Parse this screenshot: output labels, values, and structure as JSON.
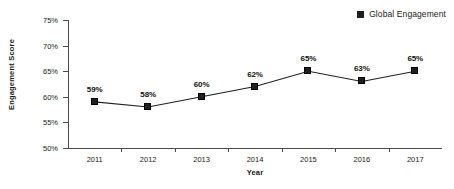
{
  "chart_data": {
    "type": "line",
    "title": "",
    "xlabel": "Year",
    "ylabel": "Engagement Score",
    "categories": [
      "2011",
      "2012",
      "2013",
      "2014",
      "2015",
      "2016",
      "2017"
    ],
    "values": [
      59,
      58,
      60,
      62,
      65,
      63,
      65
    ],
    "point_labels": [
      "59%",
      "58%",
      "60%",
      "62%",
      "65%",
      "63%",
      "65%"
    ],
    "series": [
      {
        "name": "Global Engagement",
        "values": [
          59,
          58,
          60,
          62,
          65,
          63,
          65
        ]
      }
    ],
    "ylim": [
      50,
      75
    ],
    "ytick_values": [
      75,
      70,
      65,
      60,
      55,
      50
    ],
    "ytick_labels": [
      "75%",
      "70%",
      "65%",
      "60%",
      "55%",
      "50%"
    ],
    "grid": false,
    "legend_position": "top-right",
    "marker": "square",
    "colors": {
      "series": "#1f1f1f",
      "axis": "#4a4a4a",
      "text": "#1a1a1a",
      "background": "#ffffff"
    }
  },
  "legend": {
    "entries": [
      {
        "label": "Global Engagement",
        "marker": "square-marker-icon"
      }
    ]
  },
  "axes": {
    "y_title": "Engagement Score",
    "x_title": "Year"
  }
}
